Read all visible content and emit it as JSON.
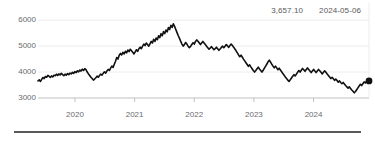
{
  "readout": {
    "value": "3,657.10",
    "date": "2024-05-06"
  },
  "colors": {
    "line": "#111111",
    "marker": "#111111",
    "grid": "#e8e8ea",
    "axis": "#b9babc",
    "label": "#6a6b6d",
    "readout_text": "#58595b",
    "rule": "#58595b",
    "background": "#ffffff"
  },
  "chart_data": {
    "type": "line",
    "title": "",
    "subtitle": "",
    "xlabel": "",
    "ylabel": "",
    "grid": true,
    "legend": null,
    "ylim": [
      3000,
      6200
    ],
    "yticks": [
      3000,
      4000,
      5000,
      6000
    ],
    "ytick_labels": [
      "3000",
      "4000",
      "5000",
      "6000"
    ],
    "xlim": [
      "2019-07",
      "2024-06"
    ],
    "xticks": [
      "2020",
      "2021",
      "2022",
      "2023",
      "2024"
    ],
    "xtick_labels": [
      "2020",
      "2021",
      "2022",
      "2023",
      "2024"
    ],
    "last_point": {
      "x": "2024-05-06",
      "y": 3657.1,
      "label": "3,657.10",
      "marker": "circle"
    },
    "series": [
      {
        "name": "index",
        "values": [
          3660,
          3700,
          3640,
          3720,
          3790,
          3750,
          3830,
          3800,
          3870,
          3840,
          3790,
          3850,
          3810,
          3880,
          3860,
          3920,
          3870,
          3930,
          3890,
          3950,
          3900,
          3860,
          3920,
          3880,
          3940,
          3900,
          3960,
          3930,
          3990,
          3950,
          4020,
          3980,
          4050,
          4010,
          4080,
          4040,
          4110,
          4060,
          4130,
          4090,
          4000,
          3930,
          3870,
          3800,
          3750,
          3690,
          3730,
          3780,
          3840,
          3800,
          3870,
          3920,
          3880,
          3950,
          4010,
          3960,
          4040,
          4100,
          4060,
          4150,
          4230,
          4180,
          4300,
          4420,
          4560,
          4500,
          4650,
          4720,
          4660,
          4760,
          4700,
          4800,
          4740,
          4850,
          4790,
          4880,
          4820,
          4760,
          4700,
          4780,
          4860,
          4800,
          4900,
          4960,
          4900,
          5000,
          5080,
          5020,
          5120,
          5060,
          5000,
          5090,
          5180,
          5120,
          5260,
          5180,
          5310,
          5250,
          5400,
          5330,
          5480,
          5400,
          5560,
          5480,
          5620,
          5550,
          5720,
          5640,
          5800,
          5720,
          5860,
          5760,
          5640,
          5520,
          5400,
          5300,
          5180,
          5080,
          5000,
          5060,
          5140,
          5080,
          5000,
          4940,
          4990,
          5060,
          5130,
          5080,
          5180,
          5240,
          5190,
          5130,
          5060,
          5120,
          5180,
          5120,
          5060,
          5000,
          4940,
          4880,
          4930,
          4980,
          4920,
          4860,
          4900,
          4960,
          4900,
          4840,
          4890,
          4950,
          5000,
          4940,
          5000,
          5060,
          5010,
          4950,
          5020,
          5080,
          5020,
          4960,
          4890,
          4820,
          4740,
          4660,
          4590,
          4650,
          4580,
          4500,
          4430,
          4360,
          4290,
          4220,
          4280,
          4200,
          4130,
          4060,
          4000,
          4060,
          4130,
          4190,
          4120,
          4060,
          4000,
          4070,
          4150,
          4230,
          4310,
          4400,
          4460,
          4380,
          4300,
          4230,
          4160,
          4230,
          4160,
          4090,
          4150,
          4080,
          4010,
          3940,
          3880,
          3810,
          3750,
          3690,
          3640,
          3700,
          3770,
          3840,
          3900,
          3850,
          3920,
          3990,
          4060,
          4000,
          4070,
          4140,
          4090,
          4030,
          4100,
          4160,
          4100,
          4040,
          3980,
          4040,
          4100,
          4040,
          3980,
          4040,
          4100,
          4050,
          3990,
          3930,
          3990,
          4050,
          3990,
          3930,
          3870,
          3810,
          3750,
          3800,
          3740,
          3680,
          3730,
          3670,
          3610,
          3660,
          3600,
          3550,
          3600,
          3540,
          3480,
          3430,
          3380,
          3430,
          3370,
          3310,
          3260,
          3200,
          3250,
          3320,
          3390,
          3460,
          3530,
          3480,
          3550,
          3620,
          3580,
          3640,
          3600,
          3657
        ]
      }
    ]
  }
}
